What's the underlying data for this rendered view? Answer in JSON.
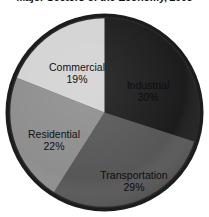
{
  "chart_data": {
    "type": "pie",
    "title": "Major Sectors of the Economy, 2005",
    "xlabel": "",
    "ylabel": "",
    "legend": "none",
    "grid": false,
    "categories": [
      "Industrial",
      "Transportation",
      "Residential",
      "Commercial"
    ],
    "values": [
      30,
      29,
      22,
      19
    ],
    "units": "percent",
    "start_angle_deg": 0,
    "direction": "clockwise",
    "slices": [
      {
        "label": "Industrial",
        "value": 30,
        "value_text": "30%",
        "color": "#3b3b3b",
        "start_deg": 0,
        "end_deg": 108
      },
      {
        "label": "Transportation",
        "value": 29,
        "value_text": "29%",
        "color": "#575757",
        "start_deg": 108,
        "end_deg": 212.4
      },
      {
        "label": "Residential",
        "value": 22,
        "value_text": "22%",
        "color": "#8e8e8e",
        "start_deg": 212.4,
        "end_deg": 291.6
      },
      {
        "label": "Commercial",
        "value": 19,
        "value_text": "19%",
        "color": "#d3d3d3",
        "start_deg": 291.6,
        "end_deg": 360
      }
    ],
    "border_color": "#1c1c1c",
    "background_color": "#ffffff"
  }
}
